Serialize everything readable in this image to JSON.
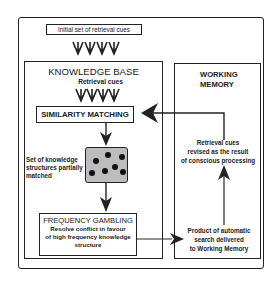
{
  "diagram": {
    "initial_cues": "Initial set of retrieval cues",
    "knowledge_base": {
      "title": "KNOWLEDGE BASE",
      "subtitle": "Retrieval cues",
      "similarity_matching": "SIMILARITY MATCHING",
      "partial_match_label": [
        "Set of knowledge",
        "structures partially",
        "matched"
      ],
      "frequency_gambling": {
        "title": "FREQUENCY GAMBLING",
        "description": [
          "Resolve conflict in favour",
          "of high frequency knowledge",
          "structure"
        ]
      }
    },
    "working_memory": {
      "title": [
        "WORKING",
        "MEMORY"
      ],
      "revised_cues": [
        "Retrieval cues",
        "revised as the result",
        "of conscious processing"
      ],
      "product": [
        "Product of automatic",
        "search delivered",
        "to Working Memory"
      ]
    },
    "colors": {
      "line": "#222222",
      "dot_fill": "#111111",
      "stipple": "#bdbdbd"
    }
  }
}
